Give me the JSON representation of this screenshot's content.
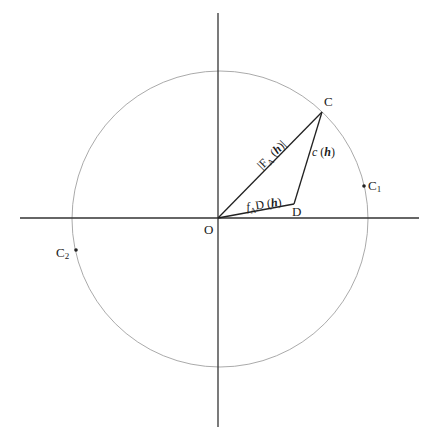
{
  "diagram": {
    "type": "argand-phasor-diagram",
    "origin_label": "O",
    "points": {
      "C": {
        "label": "C"
      },
      "D": {
        "label": "D"
      },
      "C1": {
        "label": "C",
        "sub": "1"
      },
      "C2": {
        "label": "C",
        "sub": "2"
      }
    },
    "segments": {
      "OC": {
        "pre": "|F",
        "sub": "A",
        "mid": " (",
        "h": "h",
        "post": ")|"
      },
      "OD": {
        "f": "f",
        "sub": "A",
        "mid": "D (",
        "h": "h",
        "post": ")"
      },
      "DC": {
        "c": "c",
        "mid": " (",
        "h": "h",
        "post": ")"
      }
    },
    "colors": {
      "axes": "#333333",
      "circle": "#999999",
      "lines": "#222222",
      "text": "#1a1a1a"
    }
  }
}
